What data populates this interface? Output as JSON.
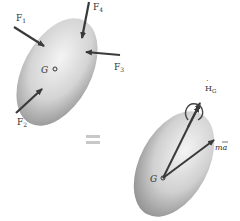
{
  "diagram": {
    "type": "free-body and kinetic diagram",
    "left_body": {
      "center_label": "G",
      "forces": [
        {
          "name": "F1",
          "label": "F",
          "sub": "1"
        },
        {
          "name": "F2",
          "label": "F",
          "sub": "2"
        },
        {
          "name": "F3",
          "label": "F",
          "sub": "3"
        },
        {
          "name": "F4",
          "label": "F",
          "sub": "4"
        }
      ]
    },
    "equals": "=",
    "right_body": {
      "center_label": "G",
      "angular_momentum_rate": {
        "label": "H",
        "sub": "G",
        "accent": "˙"
      },
      "inertia_vector": {
        "label": "ma",
        "overbar": "¯"
      }
    },
    "colors": {
      "body_light": "#f2f2f2",
      "body_dark": "#8a8a8a",
      "arrow": "#3a3a3a",
      "equals": "#c8c8c8"
    }
  }
}
